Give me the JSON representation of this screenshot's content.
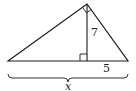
{
  "diagram": {
    "type": "right-triangle-altitude",
    "stroke_color": "#1a1a1a",
    "background": "#ffffff",
    "vertices": {
      "left": [
        8,
        61
      ],
      "apex": [
        87,
        4
      ],
      "right": [
        128,
        61
      ],
      "altitude_foot": [
        87,
        61
      ]
    },
    "labels": {
      "altitude": "7",
      "right_segment": "5",
      "base": "x"
    },
    "marks": {
      "right_angle_at_apex": true,
      "right_angle_at_foot": true,
      "base_brace": true
    }
  }
}
